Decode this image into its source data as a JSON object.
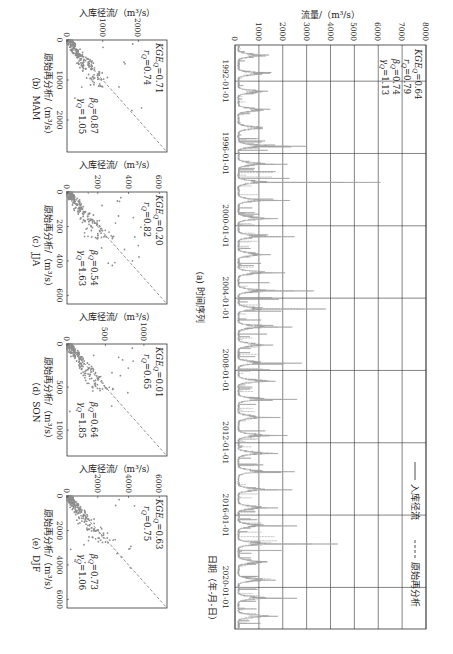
{
  "chart_data": [
    {
      "id": "a",
      "type": "line",
      "caption": "(a) 时间序列",
      "xlabel": "日期（年-月-日）",
      "ylabel": "流量/（m³/s）",
      "xticks": [
        "1992-01-01",
        "1996-01-01",
        "2000-01-01",
        "2004-01-01",
        "2008-01-01",
        "2012-01-01",
        "2016-01-01",
        "2020-01-01"
      ],
      "yticks": [
        0,
        1000,
        2000,
        3000,
        4000,
        5000,
        6000,
        7000,
        8000
      ],
      "ylim": [
        0,
        8000
      ],
      "xlim_years": [
        1990.0,
        2022.3
      ],
      "grid": true,
      "legend": [
        {
          "name": "入库径流",
          "style": "solid"
        },
        {
          "name": "原始再分析",
          "style": "dashed"
        }
      ],
      "legend_position": "top-right",
      "stats": {
        "KGE_Q": "0.64",
        "r_Q": "0.79",
        "beta_Q": "0.74",
        "gamma_Q": "1.13"
      },
      "annual_peaks": [
        {
          "year": 1990,
          "value": 700
        },
        {
          "year": 1991,
          "value": 900
        },
        {
          "year": 1992,
          "value": 600
        },
        {
          "year": 1993,
          "value": 1200
        },
        {
          "year": 1994,
          "value": 800
        },
        {
          "year": 1995,
          "value": 3000
        },
        {
          "year": 1996,
          "value": 2200
        },
        {
          "year": 1997,
          "value": 6100
        },
        {
          "year": 1998,
          "value": 2300
        },
        {
          "year": 1999,
          "value": 1800
        },
        {
          "year": 2000,
          "value": 2500
        },
        {
          "year": 2001,
          "value": 1500
        },
        {
          "year": 2002,
          "value": 2100
        },
        {
          "year": 2003,
          "value": 3300
        },
        {
          "year": 2004,
          "value": 3800
        },
        {
          "year": 2005,
          "value": 2400
        },
        {
          "year": 2006,
          "value": 1600
        },
        {
          "year": 2007,
          "value": 2800
        },
        {
          "year": 2008,
          "value": 1700
        },
        {
          "year": 2009,
          "value": 2600
        },
        {
          "year": 2010,
          "value": 1900
        },
        {
          "year": 2011,
          "value": 2200
        },
        {
          "year": 2012,
          "value": 1800
        },
        {
          "year": 2013,
          "value": 2500
        },
        {
          "year": 2014,
          "value": 2400
        },
        {
          "year": 2015,
          "value": 1800
        },
        {
          "year": 2016,
          "value": 2600
        },
        {
          "year": 2017,
          "value": 4300
        },
        {
          "year": 2018,
          "value": 1200
        },
        {
          "year": 2019,
          "value": 1700
        },
        {
          "year": 2020,
          "value": 2600
        },
        {
          "year": 2021,
          "value": 1800
        },
        {
          "year": 2022,
          "value": 600
        }
      ],
      "baseflow": 150
    },
    {
      "id": "b",
      "type": "scatter",
      "caption": "（b）MAM",
      "xlabel": "原始再分析/（m³/s）",
      "ylabel": "入库径流/（m³/s）",
      "xticks": [
        0,
        1000,
        2000
      ],
      "yticks": [
        0,
        1000,
        2000
      ],
      "xlim": [
        0,
        2800
      ],
      "ylim": [
        0,
        2800
      ],
      "reference_line": "1:1 dashed",
      "stats": {
        "KGE_Q": "0.71",
        "r_Q": "0.74",
        "beta_Q": "0.87",
        "gamma_Q": "1.05"
      }
    },
    {
      "id": "c",
      "type": "scatter",
      "caption": "（c）JJA",
      "xlabel": "原始再分析/（m³/s）",
      "ylabel": "入库径流/（m³/s）",
      "xticks": [
        0,
        200,
        400,
        600
      ],
      "yticks": [
        0,
        200,
        400,
        600
      ],
      "xlim": [
        0,
        650
      ],
      "ylim": [
        0,
        650
      ],
      "reference_line": "1:1 dashed",
      "stats": {
        "KGE_Q": "0.20",
        "r_Q": "0.82",
        "beta_Q": "0.54",
        "gamma_Q": "1.63"
      }
    },
    {
      "id": "d",
      "type": "scatter",
      "caption": "（d）SON",
      "xlabel": "原始再分析/（m³/s）",
      "ylabel": "入库径流/（m³/s）",
      "xticks": [
        0,
        500,
        1000
      ],
      "yticks": [
        0,
        500,
        1000
      ],
      "xlim": [
        0,
        1300
      ],
      "ylim": [
        0,
        1300
      ],
      "reference_line": "1:1 dashed",
      "stats": {
        "KGE_Q": "0.01",
        "r_Q": "0.65",
        "beta_Q": "0.64",
        "gamma_Q": "1.85"
      }
    },
    {
      "id": "e",
      "type": "scatter",
      "caption": "（e）DJF",
      "xlabel": "原始再分析/（m³/s）",
      "ylabel": "入库径流/（m³/s）",
      "xticks": [
        0,
        2000,
        4000,
        6000
      ],
      "yticks": [
        0,
        2000,
        4000,
        6000
      ],
      "xlim": [
        0,
        6500
      ],
      "ylim": [
        0,
        6500
      ],
      "reference_line": "1:1 dashed",
      "stats": {
        "KGE_Q": "0.63",
        "r_Q": "0.75",
        "beta_Q": "0.73",
        "gamma_Q": "1.06"
      }
    }
  ],
  "labels": {
    "kge": "KGE",
    "r": "r",
    "beta": "β",
    "gamma": "γ",
    "sub_q": "Q"
  },
  "colors": {
    "series": "#9a9a9a",
    "grid": "#333333",
    "scatter": "#8c8c8c",
    "refline": "#777777"
  }
}
